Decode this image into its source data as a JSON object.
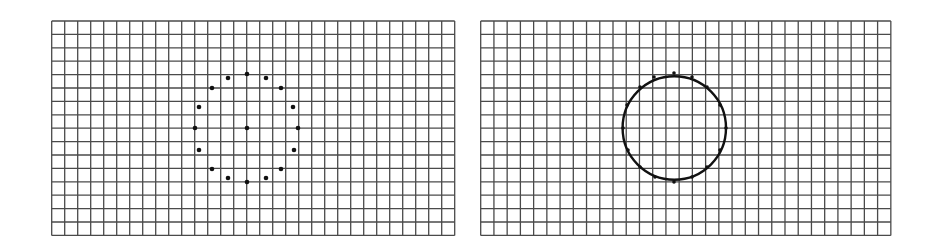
{
  "figure": {
    "background": "#ffffff",
    "grid_line_color": "#4a4a4a",
    "mark_color": "#111111"
  },
  "panels": [
    {
      "id": "left",
      "description": "grid with discrete points arranged on a circle plus center point",
      "grid": {
        "x": 51.7,
        "y": 21,
        "cols": 31,
        "rows": 16,
        "cell_w": 13.0,
        "cell_h": 13.4
      },
      "dots": [
        [
          247,
          74
        ],
        [
          228,
          78
        ],
        [
          266,
          78
        ],
        [
          212,
          88
        ],
        [
          281,
          88
        ],
        [
          199,
          107
        ],
        [
          293,
          107
        ],
        [
          195,
          128
        ],
        [
          247,
          128
        ],
        [
          298,
          128
        ],
        [
          199,
          150
        ],
        [
          294,
          150
        ],
        [
          212,
          169
        ],
        [
          281,
          169
        ],
        [
          228,
          178
        ],
        [
          266,
          178
        ],
        [
          247,
          182
        ]
      ],
      "dot_radius": 2.3,
      "circle": null
    },
    {
      "id": "right",
      "description": "grid with continuous circle drawn through the points",
      "grid": {
        "x": 480.7,
        "y": 21,
        "cols": 31,
        "rows": 16,
        "cell_w": 13.23,
        "cell_h": 13.4
      },
      "dots": [
        [
          674,
          73
        ],
        [
          654,
          77
        ],
        [
          692,
          77
        ],
        [
          640,
          87
        ],
        [
          707,
          87
        ],
        [
          627,
          105
        ],
        [
          720,
          105
        ],
        [
          623,
          128
        ],
        [
          726,
          128
        ],
        [
          628,
          150
        ],
        [
          720,
          150
        ],
        [
          640,
          167
        ],
        [
          707,
          167
        ],
        [
          655,
          177
        ],
        [
          692,
          177
        ],
        [
          674,
          182
        ]
      ],
      "dot_radius": 1.8,
      "circle": {
        "cx": 674.3,
        "cy": 128,
        "r": 51.7,
        "stroke_width": 2.4
      }
    }
  ]
}
